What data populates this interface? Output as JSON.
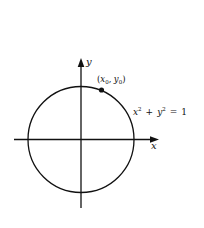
{
  "diagram": {
    "type": "unit-circle",
    "colors": {
      "stroke": "#111111",
      "background": "#ffffff"
    },
    "axes": {
      "x_label": "x",
      "y_label": "y"
    },
    "circle": {
      "equation": {
        "x": "x",
        "x_exp": "2",
        "plus": "+",
        "y": "y",
        "y_exp": "2",
        "equals": "=",
        "rhs": "1"
      }
    },
    "point": {
      "label": {
        "open": "(",
        "x": "x",
        "x_sub": "0",
        "comma": ",",
        "y": "y",
        "y_sub": "0",
        "close": ")"
      }
    }
  }
}
